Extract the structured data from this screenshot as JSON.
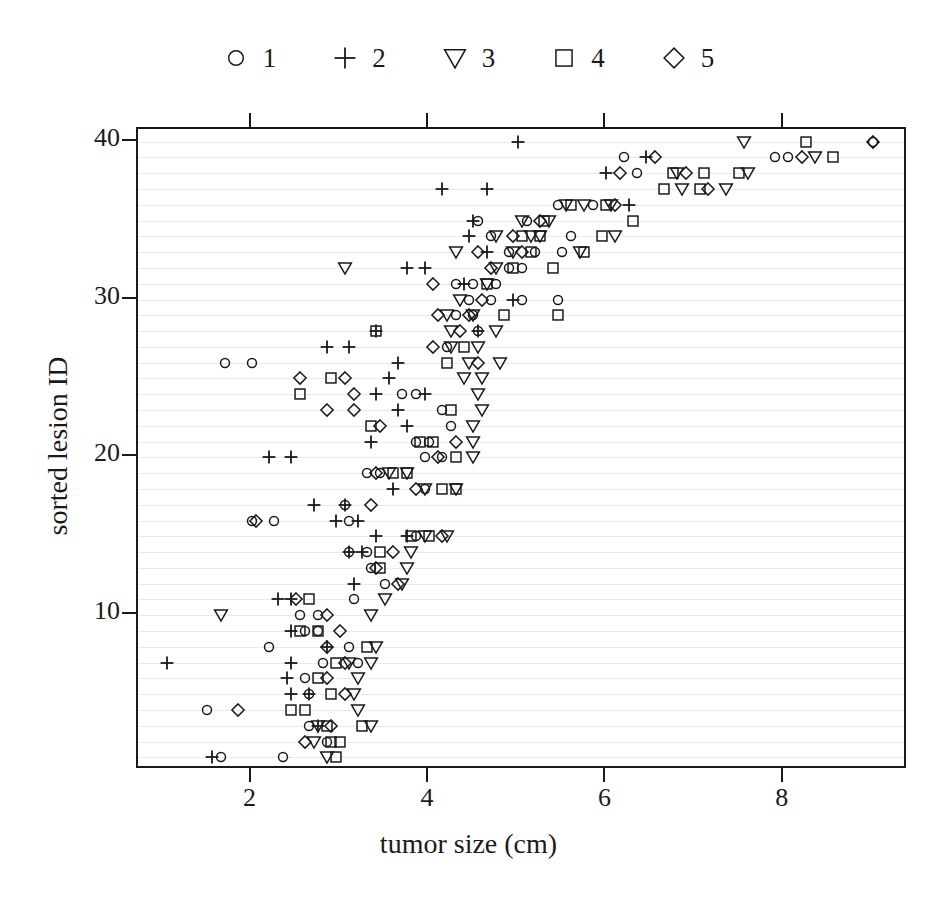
{
  "chart_data": {
    "type": "scatter",
    "title": "",
    "xlabel": "tumor size (cm)",
    "ylabel": "sorted lesion ID",
    "xlim": [
      0.72,
      9.4
    ],
    "ylim": [
      0.2,
      40.8
    ],
    "xticks": [
      2,
      4,
      6,
      8
    ],
    "yticks": [
      10,
      20,
      30,
      40
    ],
    "grid": true,
    "grid_axis": "y",
    "grid_step": 1,
    "legend_position": "top-center",
    "legend_title": "",
    "marker_map": {
      "1": "circle",
      "2": "plus",
      "3": "triangle-down",
      "4": "square",
      "5": "diamond"
    },
    "series": [
      {
        "name": "1",
        "marker": "circle",
        "points": [
          [
            1.65,
            1
          ],
          [
            2.35,
            1
          ],
          [
            2.85,
            2
          ],
          [
            2.65,
            3
          ],
          [
            1.5,
            4
          ],
          [
            2.65,
            5
          ],
          [
            2.6,
            6
          ],
          [
            2.8,
            7
          ],
          [
            3.2,
            7
          ],
          [
            2.2,
            8
          ],
          [
            3.1,
            8
          ],
          [
            2.6,
            9
          ],
          [
            2.75,
            9
          ],
          [
            2.55,
            10
          ],
          [
            2.75,
            10
          ],
          [
            3.15,
            11
          ],
          [
            3.5,
            12
          ],
          [
            3.35,
            13
          ],
          [
            3.1,
            14
          ],
          [
            3.3,
            14
          ],
          [
            3.85,
            15
          ],
          [
            2.0,
            16
          ],
          [
            2.25,
            16
          ],
          [
            3.1,
            16
          ],
          [
            3.05,
            17
          ],
          [
            3.95,
            18
          ],
          [
            3.3,
            19
          ],
          [
            3.45,
            19
          ],
          [
            3.95,
            20
          ],
          [
            4.15,
            20
          ],
          [
            3.85,
            21
          ],
          [
            4.0,
            21
          ],
          [
            4.25,
            22
          ],
          [
            4.15,
            23
          ],
          [
            3.7,
            24
          ],
          [
            3.85,
            24
          ],
          [
            1.7,
            26
          ],
          [
            2.0,
            26
          ],
          [
            4.2,
            27
          ],
          [
            4.55,
            28
          ],
          [
            4.3,
            29
          ],
          [
            4.5,
            29
          ],
          [
            4.45,
            30
          ],
          [
            4.7,
            30
          ],
          [
            5.05,
            30
          ],
          [
            5.45,
            30
          ],
          [
            4.3,
            31
          ],
          [
            4.5,
            31
          ],
          [
            4.75,
            31
          ],
          [
            4.9,
            32
          ],
          [
            5.05,
            32
          ],
          [
            4.9,
            33
          ],
          [
            5.2,
            33
          ],
          [
            5.5,
            33
          ],
          [
            4.7,
            34
          ],
          [
            5.6,
            34
          ],
          [
            4.55,
            35
          ],
          [
            5.1,
            35
          ],
          [
            5.45,
            36
          ],
          [
            5.85,
            36
          ],
          [
            6.35,
            38
          ],
          [
            6.2,
            39
          ],
          [
            7.9,
            39
          ],
          [
            8.05,
            39
          ],
          [
            9.0,
            40
          ]
        ]
      },
      {
        "name": "2",
        "marker": "plus",
        "points": [
          [
            1.55,
            1
          ],
          [
            2.75,
            3
          ],
          [
            2.45,
            5
          ],
          [
            2.65,
            5
          ],
          [
            2.4,
            6
          ],
          [
            1.05,
            7
          ],
          [
            2.45,
            7
          ],
          [
            2.85,
            8
          ],
          [
            2.45,
            9
          ],
          [
            2.3,
            11
          ],
          [
            2.45,
            11
          ],
          [
            3.15,
            12
          ],
          [
            3.1,
            14
          ],
          [
            3.25,
            14
          ],
          [
            3.4,
            15
          ],
          [
            3.75,
            15
          ],
          [
            2.95,
            16
          ],
          [
            3.2,
            16
          ],
          [
            2.7,
            17
          ],
          [
            3.05,
            17
          ],
          [
            3.6,
            18
          ],
          [
            2.2,
            20
          ],
          [
            2.45,
            20
          ],
          [
            3.35,
            21
          ],
          [
            3.75,
            22
          ],
          [
            3.65,
            23
          ],
          [
            3.4,
            24
          ],
          [
            3.95,
            24
          ],
          [
            3.55,
            25
          ],
          [
            3.65,
            26
          ],
          [
            2.85,
            27
          ],
          [
            3.1,
            27
          ],
          [
            3.4,
            28
          ],
          [
            4.55,
            28
          ],
          [
            4.95,
            30
          ],
          [
            4.4,
            31
          ],
          [
            3.75,
            32
          ],
          [
            3.95,
            32
          ],
          [
            4.65,
            33
          ],
          [
            4.45,
            34
          ],
          [
            4.5,
            35
          ],
          [
            6.25,
            36
          ],
          [
            4.15,
            37
          ],
          [
            4.65,
            37
          ],
          [
            6.0,
            38
          ],
          [
            6.45,
            39
          ],
          [
            5.0,
            40
          ]
        ]
      },
      {
        "name": "3",
        "marker": "triangle-down",
        "points": [
          [
            2.85,
            1
          ],
          [
            2.7,
            2
          ],
          [
            2.75,
            3
          ],
          [
            3.35,
            3
          ],
          [
            3.2,
            4
          ],
          [
            3.15,
            5
          ],
          [
            3.2,
            6
          ],
          [
            3.1,
            7
          ],
          [
            3.35,
            7
          ],
          [
            3.4,
            8
          ],
          [
            1.65,
            10
          ],
          [
            3.35,
            10
          ],
          [
            3.5,
            11
          ],
          [
            3.7,
            12
          ],
          [
            3.75,
            13
          ],
          [
            3.8,
            14
          ],
          [
            3.95,
            15
          ],
          [
            4.2,
            15
          ],
          [
            3.95,
            18
          ],
          [
            4.3,
            18
          ],
          [
            3.55,
            19
          ],
          [
            3.75,
            19
          ],
          [
            4.5,
            20
          ],
          [
            4.5,
            21
          ],
          [
            4.5,
            22
          ],
          [
            4.6,
            23
          ],
          [
            4.55,
            24
          ],
          [
            4.4,
            25
          ],
          [
            4.6,
            25
          ],
          [
            4.45,
            26
          ],
          [
            4.8,
            26
          ],
          [
            4.25,
            27
          ],
          [
            4.55,
            27
          ],
          [
            4.25,
            28
          ],
          [
            4.75,
            28
          ],
          [
            4.2,
            29
          ],
          [
            4.5,
            29
          ],
          [
            4.35,
            30
          ],
          [
            4.65,
            31
          ],
          [
            3.05,
            32
          ],
          [
            4.75,
            32
          ],
          [
            4.3,
            33
          ],
          [
            4.95,
            33
          ],
          [
            5.7,
            33
          ],
          [
            4.75,
            34
          ],
          [
            5.15,
            34
          ],
          [
            5.25,
            34
          ],
          [
            6.1,
            34
          ],
          [
            5.05,
            35
          ],
          [
            5.35,
            35
          ],
          [
            5.55,
            36
          ],
          [
            5.75,
            36
          ],
          [
            6.05,
            36
          ],
          [
            6.85,
            37
          ],
          [
            7.35,
            37
          ],
          [
            6.8,
            38
          ],
          [
            7.6,
            38
          ],
          [
            8.35,
            39
          ],
          [
            7.55,
            40
          ]
        ]
      },
      {
        "name": "4",
        "marker": "square",
        "points": [
          [
            2.95,
            1
          ],
          [
            2.9,
            2
          ],
          [
            3.0,
            2
          ],
          [
            2.85,
            3
          ],
          [
            3.25,
            3
          ],
          [
            2.45,
            4
          ],
          [
            2.6,
            4
          ],
          [
            2.9,
            5
          ],
          [
            2.75,
            6
          ],
          [
            2.95,
            7
          ],
          [
            3.3,
            8
          ],
          [
            2.55,
            9
          ],
          [
            2.75,
            9
          ],
          [
            2.65,
            11
          ],
          [
            3.45,
            13
          ],
          [
            3.45,
            14
          ],
          [
            3.8,
            15
          ],
          [
            4.0,
            15
          ],
          [
            4.15,
            18
          ],
          [
            4.3,
            18
          ],
          [
            3.6,
            19
          ],
          [
            3.75,
            19
          ],
          [
            4.3,
            20
          ],
          [
            3.9,
            21
          ],
          [
            4.05,
            21
          ],
          [
            3.35,
            22
          ],
          [
            4.25,
            23
          ],
          [
            2.55,
            24
          ],
          [
            2.9,
            25
          ],
          [
            4.2,
            26
          ],
          [
            4.4,
            27
          ],
          [
            3.4,
            28
          ],
          [
            4.85,
            29
          ],
          [
            5.45,
            29
          ],
          [
            4.65,
            31
          ],
          [
            4.95,
            32
          ],
          [
            5.4,
            32
          ],
          [
            5.15,
            33
          ],
          [
            5.75,
            33
          ],
          [
            5.05,
            34
          ],
          [
            5.25,
            34
          ],
          [
            5.95,
            34
          ],
          [
            5.3,
            35
          ],
          [
            6.3,
            35
          ],
          [
            5.6,
            36
          ],
          [
            6.0,
            36
          ],
          [
            6.65,
            37
          ],
          [
            7.05,
            37
          ],
          [
            6.75,
            38
          ],
          [
            7.1,
            38
          ],
          [
            7.5,
            38
          ],
          [
            8.55,
            39
          ],
          [
            8.25,
            40
          ]
        ]
      },
      {
        "name": "5",
        "marker": "diamond",
        "points": [
          [
            2.6,
            2
          ],
          [
            2.9,
            3
          ],
          [
            1.85,
            4
          ],
          [
            3.05,
            5
          ],
          [
            2.85,
            6
          ],
          [
            3.05,
            7
          ],
          [
            2.85,
            8
          ],
          [
            3.0,
            9
          ],
          [
            2.85,
            10
          ],
          [
            2.5,
            11
          ],
          [
            3.65,
            12
          ],
          [
            3.4,
            13
          ],
          [
            3.6,
            14
          ],
          [
            4.15,
            15
          ],
          [
            2.05,
            16
          ],
          [
            3.35,
            17
          ],
          [
            3.85,
            18
          ],
          [
            3.4,
            19
          ],
          [
            4.1,
            20
          ],
          [
            4.3,
            21
          ],
          [
            3.45,
            22
          ],
          [
            2.85,
            23
          ],
          [
            3.15,
            23
          ],
          [
            3.15,
            24
          ],
          [
            2.55,
            25
          ],
          [
            3.05,
            25
          ],
          [
            4.55,
            26
          ],
          [
            4.05,
            27
          ],
          [
            4.35,
            28
          ],
          [
            4.1,
            29
          ],
          [
            4.45,
            29
          ],
          [
            4.6,
            30
          ],
          [
            4.05,
            31
          ],
          [
            4.7,
            32
          ],
          [
            4.55,
            33
          ],
          [
            5.05,
            33
          ],
          [
            4.95,
            34
          ],
          [
            5.25,
            35
          ],
          [
            6.1,
            36
          ],
          [
            7.15,
            37
          ],
          [
            6.15,
            38
          ],
          [
            6.9,
            38
          ],
          [
            6.55,
            39
          ],
          [
            8.2,
            39
          ],
          [
            9.0,
            40
          ]
        ]
      }
    ]
  },
  "legend": {
    "items": [
      {
        "label": "1",
        "marker": "circle"
      },
      {
        "label": "2",
        "marker": "plus"
      },
      {
        "label": "3",
        "marker": "triangle-down"
      },
      {
        "label": "4",
        "marker": "square"
      },
      {
        "label": "5",
        "marker": "diamond"
      }
    ]
  },
  "axes": {
    "x_title": "tumor size (cm)",
    "y_title": "sorted lesion ID",
    "x_tick_labels": [
      "2",
      "4",
      "6",
      "8"
    ],
    "y_tick_labels": [
      "10",
      "20",
      "30",
      "40"
    ]
  },
  "colors": {
    "foreground": "#1a1a1a",
    "gridline": "#e9e9ee",
    "background": "#ffffff"
  }
}
